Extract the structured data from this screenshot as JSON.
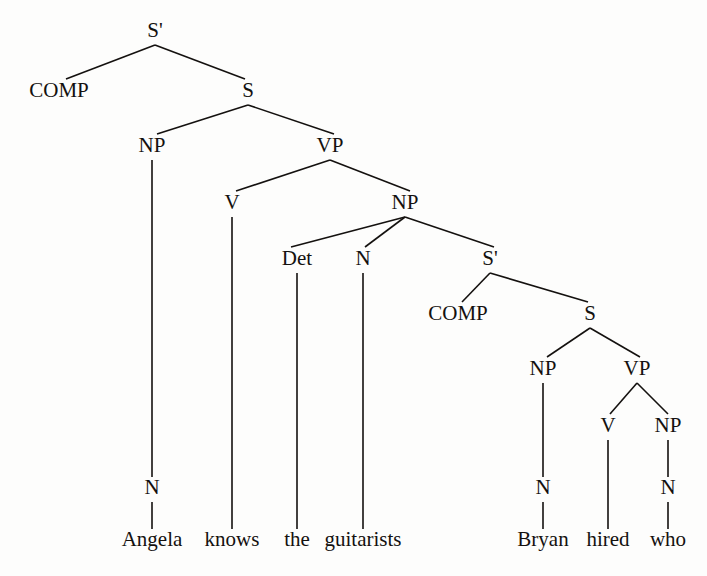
{
  "figure": {
    "kind": "syntax-tree",
    "sentence": "Angela knows the guitarists Bryan hired who",
    "background_color": "#fdfdfc",
    "line_color": "#14110f",
    "text_color": "#14110f"
  },
  "nodes": [
    {
      "id": "s-bar-root",
      "label": "S'",
      "x": 155,
      "y": 37
    },
    {
      "id": "comp-matrix",
      "label": "COMP",
      "x": 59,
      "y": 97
    },
    {
      "id": "s-matrix",
      "label": "S",
      "x": 248,
      "y": 97
    },
    {
      "id": "np-subject",
      "label": "NP",
      "x": 152,
      "y": 152
    },
    {
      "id": "vp-matrix",
      "label": "VP",
      "x": 330,
      "y": 152
    },
    {
      "id": "v-matrix",
      "label": "V",
      "x": 232,
      "y": 209
    },
    {
      "id": "np-object",
      "label": "NP",
      "x": 405,
      "y": 209
    },
    {
      "id": "det-object",
      "label": "Det",
      "x": 297,
      "y": 265
    },
    {
      "id": "n-object",
      "label": "N",
      "x": 363,
      "y": 265
    },
    {
      "id": "s-bar-relative",
      "label": "S'",
      "x": 490,
      "y": 265
    },
    {
      "id": "comp-relative",
      "label": "COMP",
      "x": 458,
      "y": 320
    },
    {
      "id": "s-relative",
      "label": "S",
      "x": 590,
      "y": 320
    },
    {
      "id": "np-embedded",
      "label": "NP",
      "x": 543,
      "y": 375
    },
    {
      "id": "vp-embedded",
      "label": "VP",
      "x": 637,
      "y": 375
    },
    {
      "id": "v-embedded",
      "label": "V",
      "x": 608,
      "y": 432
    },
    {
      "id": "np-embedded-obj",
      "label": "NP",
      "x": 668,
      "y": 432
    },
    {
      "id": "n-subject",
      "label": "N",
      "x": 152,
      "y": 494
    },
    {
      "id": "n-embedded",
      "label": "N",
      "x": 543,
      "y": 494
    },
    {
      "id": "n-embedded-obj",
      "label": "N",
      "x": 668,
      "y": 494
    }
  ],
  "terminals": [
    {
      "id": "word-angela",
      "label": "Angela",
      "x": 152,
      "y": 546
    },
    {
      "id": "word-knows",
      "label": "knows",
      "x": 232,
      "y": 546
    },
    {
      "id": "word-the",
      "label": "the",
      "x": 297,
      "y": 546
    },
    {
      "id": "word-guitarists",
      "label": "guitarists",
      "x": 363,
      "y": 546
    },
    {
      "id": "word-bryan",
      "label": "Bryan",
      "x": 543,
      "y": 546
    },
    {
      "id": "word-hired",
      "label": "hired",
      "x": 608,
      "y": 546
    },
    {
      "id": "word-who",
      "label": "who",
      "x": 668,
      "y": 546
    }
  ],
  "edges": [
    {
      "id": "edge-sbar-comp",
      "from": "s-bar-root",
      "to": "comp-matrix",
      "x1": 155,
      "y1": 45,
      "x2": 66,
      "y2": 79
    },
    {
      "id": "edge-sbar-s",
      "from": "s-bar-root",
      "to": "s-matrix",
      "x1": 155,
      "y1": 45,
      "x2": 245,
      "y2": 79
    },
    {
      "id": "edge-s-np",
      "from": "s-matrix",
      "to": "np-subject",
      "x1": 248,
      "y1": 105,
      "x2": 157,
      "y2": 134
    },
    {
      "id": "edge-s-vp",
      "from": "s-matrix",
      "to": "vp-matrix",
      "x1": 248,
      "y1": 105,
      "x2": 334,
      "y2": 134
    },
    {
      "id": "edge-vp-v",
      "from": "vp-matrix",
      "to": "v-matrix",
      "x1": 330,
      "y1": 160,
      "x2": 236,
      "y2": 191
    },
    {
      "id": "edge-vp-np",
      "from": "vp-matrix",
      "to": "np-object",
      "x1": 330,
      "y1": 160,
      "x2": 410,
      "y2": 191
    },
    {
      "id": "edge-np-det",
      "from": "np-object",
      "to": "det-object",
      "x1": 405,
      "y1": 217,
      "x2": 291,
      "y2": 247
    },
    {
      "id": "edge-np-n",
      "from": "np-object",
      "to": "n-object",
      "x1": 405,
      "y1": 217,
      "x2": 365,
      "y2": 247
    },
    {
      "id": "edge-np-sbar",
      "from": "np-object",
      "to": "s-bar-relative",
      "x1": 405,
      "y1": 217,
      "x2": 494,
      "y2": 247
    },
    {
      "id": "edge-sbar-comp-rel",
      "from": "s-bar-relative",
      "to": "comp-relative",
      "x1": 490,
      "y1": 273,
      "x2": 462,
      "y2": 302
    },
    {
      "id": "edge-sbar-s-rel",
      "from": "s-bar-relative",
      "to": "s-relative",
      "x1": 490,
      "y1": 273,
      "x2": 588,
      "y2": 302
    },
    {
      "id": "edge-s-np-emb",
      "from": "s-relative",
      "to": "np-embedded",
      "x1": 590,
      "y1": 328,
      "x2": 547,
      "y2": 357
    },
    {
      "id": "edge-s-vp-emb",
      "from": "s-relative",
      "to": "vp-embedded",
      "x1": 590,
      "y1": 328,
      "x2": 640,
      "y2": 357
    },
    {
      "id": "edge-vp-v-emb",
      "from": "vp-embedded",
      "to": "v-embedded",
      "x1": 637,
      "y1": 383,
      "x2": 610,
      "y2": 414
    },
    {
      "id": "edge-vp-np-emb",
      "from": "vp-embedded",
      "to": "np-embedded-obj",
      "x1": 637,
      "y1": 383,
      "x2": 668,
      "y2": 414
    },
    {
      "id": "edge-np-n-subject",
      "from": "np-subject",
      "to": "n-subject",
      "x1": 152,
      "y1": 160,
      "x2": 152,
      "y2": 477
    },
    {
      "id": "edge-np-n-emb",
      "from": "np-embedded",
      "to": "n-embedded",
      "x1": 543,
      "y1": 383,
      "x2": 543,
      "y2": 477
    },
    {
      "id": "edge-np-n-emb-obj",
      "from": "np-embedded-obj",
      "to": "n-embedded-obj",
      "x1": 668,
      "y1": 440,
      "x2": 668,
      "y2": 477
    },
    {
      "id": "edge-n-angela",
      "from": "n-subject",
      "to": "word-angela",
      "x1": 152,
      "y1": 502,
      "x2": 152,
      "y2": 529
    },
    {
      "id": "edge-v-knows",
      "from": "v-matrix",
      "to": "word-knows",
      "x1": 232,
      "y1": 217,
      "x2": 232,
      "y2": 529
    },
    {
      "id": "edge-det-the",
      "from": "det-object",
      "to": "word-the",
      "x1": 297,
      "y1": 273,
      "x2": 297,
      "y2": 529
    },
    {
      "id": "edge-n-guitarists",
      "from": "n-object",
      "to": "word-guitarists",
      "x1": 363,
      "y1": 273,
      "x2": 363,
      "y2": 529
    },
    {
      "id": "edge-n-bryan",
      "from": "n-embedded",
      "to": "word-bryan",
      "x1": 543,
      "y1": 502,
      "x2": 543,
      "y2": 529
    },
    {
      "id": "edge-v-hired",
      "from": "v-embedded",
      "to": "word-hired",
      "x1": 608,
      "y1": 440,
      "x2": 608,
      "y2": 529
    },
    {
      "id": "edge-n-who",
      "from": "n-embedded-obj",
      "to": "word-who",
      "x1": 668,
      "y1": 502,
      "x2": 668,
      "y2": 529
    }
  ]
}
